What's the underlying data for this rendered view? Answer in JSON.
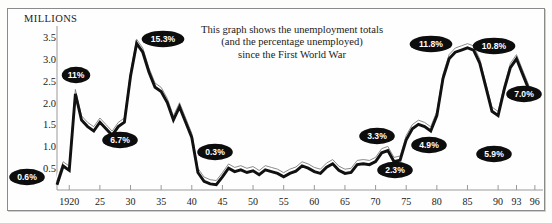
{
  "chart_data": {
    "type": "line",
    "title": "",
    "annotation_text": [
      "This graph shows the unemployment totals",
      "(and the percentage unemployed)",
      "since the First World War"
    ],
    "ylabel": "MILLIONS",
    "xlabel": "",
    "ylim": [
      0,
      3.75
    ],
    "xlim": [
      1918,
      1997
    ],
    "grid": false,
    "legend": "none",
    "ytick_labels": [
      "0.5",
      "1.0",
      "1.5",
      "2.0",
      "2.5",
      "3.0",
      "3.5"
    ],
    "ytick_values": [
      0.5,
      1.0,
      1.5,
      2.0,
      2.5,
      3.0,
      3.5
    ],
    "xtick_labels": [
      "1920",
      "25",
      "30",
      "35",
      "40",
      "45",
      "50",
      "55",
      "60",
      "65",
      "70",
      "75",
      "80",
      "85",
      "90",
      "93",
      "96"
    ],
    "xtick_values": [
      1920,
      1925,
      1930,
      1935,
      1940,
      1945,
      1950,
      1955,
      1960,
      1965,
      1970,
      1975,
      1980,
      1985,
      1990,
      1993,
      1996
    ],
    "series": [
      {
        "name": "Unemployment total (millions)",
        "x": [
          1918,
          1919,
          1920,
          1921,
          1922,
          1923,
          1924,
          1925,
          1926,
          1927,
          1928,
          1929,
          1930,
          1931,
          1932,
          1933,
          1934,
          1935,
          1936,
          1937,
          1938,
          1939,
          1940,
          1941,
          1942,
          1943,
          1944,
          1945,
          1946,
          1947,
          1948,
          1949,
          1950,
          1951,
          1952,
          1953,
          1954,
          1955,
          1956,
          1957,
          1958,
          1959,
          1960,
          1961,
          1962,
          1963,
          1964,
          1965,
          1966,
          1967,
          1968,
          1969,
          1970,
          1971,
          1972,
          1973,
          1974,
          1975,
          1976,
          1977,
          1978,
          1979,
          1980,
          1981,
          1982,
          1983,
          1984,
          1985,
          1986,
          1987,
          1988,
          1989,
          1990,
          1991,
          1992,
          1993,
          1994,
          1995,
          1996
        ],
        "values": [
          0.12,
          0.55,
          0.45,
          2.2,
          1.6,
          1.45,
          1.35,
          1.55,
          1.4,
          1.25,
          1.45,
          1.55,
          2.6,
          3.35,
          3.15,
          2.7,
          2.35,
          2.25,
          2.0,
          1.6,
          1.9,
          1.55,
          1.2,
          0.4,
          0.2,
          0.14,
          0.12,
          0.3,
          0.5,
          0.42,
          0.46,
          0.4,
          0.44,
          0.35,
          0.46,
          0.42,
          0.38,
          0.3,
          0.38,
          0.43,
          0.55,
          0.5,
          0.42,
          0.38,
          0.52,
          0.6,
          0.45,
          0.38,
          0.4,
          0.58,
          0.6,
          0.58,
          0.65,
          0.85,
          0.9,
          0.65,
          0.68,
          1.15,
          1.4,
          1.5,
          1.45,
          1.35,
          1.7,
          2.55,
          3.0,
          3.15,
          3.2,
          3.25,
          3.2,
          2.9,
          2.35,
          1.8,
          1.7,
          2.3,
          2.8,
          3.0,
          2.65,
          2.3,
          2.1
        ]
      }
    ],
    "annotations": [
      {
        "label": "0.6%",
        "x": 1918.4,
        "y": 0.25,
        "px": 27,
        "py": 177
      },
      {
        "label": "11%",
        "x": 1921,
        "y": 2.62,
        "px": 76,
        "py": 75
      },
      {
        "label": "6.7%",
        "x": 1927,
        "y": 1.02,
        "px": 120,
        "py": 140
      },
      {
        "label": "15.3%",
        "x": 1932.6,
        "y": 3.62,
        "px": 163,
        "py": 39
      },
      {
        "label": "0.3%",
        "x": 1943.8,
        "y": 0.62,
        "px": 215,
        "py": 152
      },
      {
        "label": "3.3%",
        "x": 1972.5,
        "y": 1.15,
        "px": 377,
        "py": 136
      },
      {
        "label": "2.3%",
        "x": 1974.5,
        "y": 0.42,
        "px": 395,
        "py": 170
      },
      {
        "label": "4.9%",
        "x": 1977.5,
        "y": 0.95,
        "px": 429,
        "py": 145
      },
      {
        "label": "11.8%",
        "x": 1982.5,
        "y": 3.55,
        "px": 431,
        "py": 44
      },
      {
        "label": "5.9%",
        "x": 1989.5,
        "y": 1.28,
        "px": 494,
        "py": 154
      },
      {
        "label": "10.8%",
        "x": 1990.5,
        "y": 3.5,
        "px": 494,
        "py": 46
      },
      {
        "label": "7.0%",
        "x": 1994.2,
        "y": 2.35,
        "px": 524,
        "py": 94
      }
    ]
  },
  "axes": {
    "y_title": "MILLIONS"
  }
}
